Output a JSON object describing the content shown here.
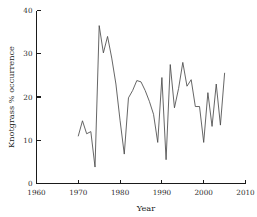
{
  "chart_data": {
    "type": "line",
    "title": "",
    "xlabel": "Year",
    "ylabel": "Knotgrass % occurrence",
    "xlim": [
      1960,
      2010
    ],
    "ylim": [
      0,
      40
    ],
    "grid": false,
    "legend": null,
    "xticks": [
      1960,
      1970,
      1980,
      1990,
      2000,
      2010
    ],
    "yticks": [
      0,
      10,
      20,
      30,
      40
    ],
    "xtick_labels": [
      "1960",
      "1970",
      "1980",
      "1990",
      "2000",
      "2010"
    ],
    "ytick_labels": [
      "0",
      "10",
      "20",
      "30",
      "40"
    ],
    "series": [
      {
        "name": "Knotgrass % occurrence",
        "color": "#4a4a4a",
        "x": [
          1970,
          1971,
          1972,
          1973,
          1974,
          1975,
          1976,
          1977,
          1978,
          1979,
          1980,
          1981,
          1982,
          1983,
          1984,
          1985,
          1986,
          1987,
          1988,
          1989,
          1990,
          1991,
          1992,
          1993,
          1994,
          1995,
          1996,
          1997,
          1998,
          1999,
          2000,
          2001,
          2002,
          2003,
          2004,
          2005
        ],
        "values": [
          11.0,
          14.5,
          11.5,
          12.0,
          3.8,
          36.5,
          30.2,
          34.0,
          29.0,
          23.0,
          14.5,
          6.8,
          19.8,
          21.5,
          23.8,
          23.5,
          21.5,
          19.0,
          16.0,
          9.5,
          24.5,
          5.5,
          27.5,
          17.5,
          22.0,
          28.0,
          22.5,
          24.0,
          17.8,
          17.8,
          9.5,
          21.0,
          13.2,
          23.0,
          13.5,
          25.5
        ]
      }
    ]
  },
  "axes": {
    "x_label": "Year",
    "y_label": "Knotgrass % occurrence"
  }
}
